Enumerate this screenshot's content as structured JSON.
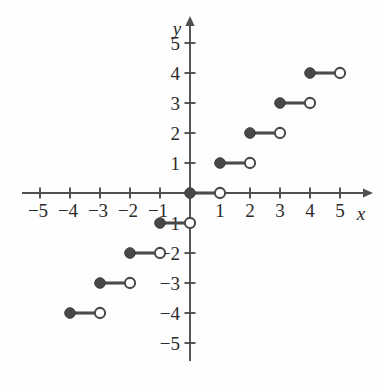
{
  "figure": {
    "title": "",
    "background_color": "#fefefe",
    "axis_color": "#4f4f4f",
    "curve_color": "#4a4a4a",
    "label_color": "#2b2b2b"
  },
  "axes": {
    "x_axis_label": "x",
    "y_axis_label": "y",
    "origin_px": {
      "x": 190,
      "y": 193
    },
    "unit_px": 30,
    "x_tick_values": [
      -5,
      -4,
      -3,
      -2,
      -1,
      1,
      2,
      3,
      4,
      5
    ],
    "y_tick_values": [
      5,
      4,
      3,
      2,
      1,
      -1,
      -2,
      -3,
      -4,
      -5
    ],
    "x_tick_labels": [
      "−5",
      "−4",
      "−3",
      "−2",
      "−1",
      "1",
      "2",
      "3",
      "4",
      "5"
    ],
    "y_tick_labels": [
      "5",
      "4",
      "3",
      "2",
      "1",
      "−1",
      "−2",
      "−3",
      "−4",
      "−5"
    ],
    "x_range": [
      -5.6,
      6.1
    ],
    "y_range": [
      -5.6,
      5.9
    ],
    "grid": false,
    "x_arrow": true,
    "y_arrow": true
  },
  "chart_data": {
    "type": "line",
    "title": "",
    "xlabel": "x",
    "ylabel": "y",
    "xlim": [
      -5.6,
      6.1
    ],
    "ylim": [
      -5.6,
      5.9
    ],
    "grid": false,
    "legend": null,
    "function": "y = floor(x)",
    "steps": [
      {
        "y": 4,
        "x_start": 4,
        "x_end": 5,
        "left_endpoint": "closed",
        "right_endpoint": "open"
      },
      {
        "y": 3,
        "x_start": 3,
        "x_end": 4,
        "left_endpoint": "closed",
        "right_endpoint": "open"
      },
      {
        "y": 2,
        "x_start": 2,
        "x_end": 3,
        "left_endpoint": "closed",
        "right_endpoint": "open"
      },
      {
        "y": 1,
        "x_start": 1,
        "x_end": 2,
        "left_endpoint": "closed",
        "right_endpoint": "open"
      },
      {
        "y": 0,
        "x_start": 0,
        "x_end": 1,
        "left_endpoint": "closed",
        "right_endpoint": "open"
      },
      {
        "y": -1,
        "x_start": -1,
        "x_end": 0,
        "left_endpoint": "closed",
        "right_endpoint": "open"
      },
      {
        "y": -2,
        "x_start": -2,
        "x_end": -1,
        "left_endpoint": "closed",
        "right_endpoint": "open"
      },
      {
        "y": -3,
        "x_start": -3,
        "x_end": -2,
        "left_endpoint": "closed",
        "right_endpoint": "open"
      },
      {
        "y": -4,
        "x_start": -4,
        "x_end": -3,
        "left_endpoint": "closed",
        "right_endpoint": "open"
      }
    ],
    "closed_points": [
      {
        "x": 4,
        "y": 4
      },
      {
        "x": 3,
        "y": 3
      },
      {
        "x": 2,
        "y": 2
      },
      {
        "x": 1,
        "y": 1
      },
      {
        "x": 0,
        "y": 0
      },
      {
        "x": -1,
        "y": -1
      },
      {
        "x": -2,
        "y": -2
      },
      {
        "x": -3,
        "y": -3
      },
      {
        "x": -4,
        "y": -4
      }
    ],
    "open_points": [
      {
        "x": 5,
        "y": 4
      },
      {
        "x": 4,
        "y": 3
      },
      {
        "x": 3,
        "y": 2
      },
      {
        "x": 2,
        "y": 1
      },
      {
        "x": 1,
        "y": 0
      },
      {
        "x": 0,
        "y": -1
      },
      {
        "x": -1,
        "y": -2
      },
      {
        "x": -2,
        "y": -3
      },
      {
        "x": -3,
        "y": -4
      }
    ]
  }
}
